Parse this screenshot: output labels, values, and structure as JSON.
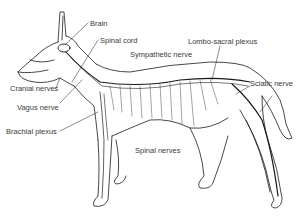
{
  "diagram": {
    "labels": {
      "brain": "Brain",
      "spinal_cord": "Spinal cord",
      "sympathetic_nerve": "Sympathetic nerve",
      "lombo_sacral_plexus": "Lombo-sacral plexus",
      "cranial_nerves": "Cranial nerves",
      "sciatic_nerve": "Sciatic nerve",
      "vagus_nerve": "Vagus nerve",
      "brachial_plexus": "Brachial plexus",
      "spinal_nerves": "Spinal nerves"
    },
    "colors": {
      "line": "#1a1a1a",
      "text": "#3a3a3a",
      "background": "#ffffff"
    }
  }
}
